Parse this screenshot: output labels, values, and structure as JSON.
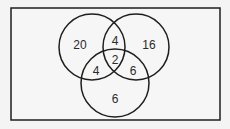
{
  "diagram": {
    "type": "venn",
    "sets": 3,
    "regions": {
      "a_only": "20",
      "b_only": "16",
      "c_only": "6",
      "a_and_b_only": "4",
      "a_and_c_only": "4",
      "b_and_c_only": "6",
      "a_and_b_and_c": "2"
    },
    "colors": {
      "stroke": "#1e1e1e",
      "background": "#f4f4f4",
      "text": "#2a2a2a"
    }
  }
}
